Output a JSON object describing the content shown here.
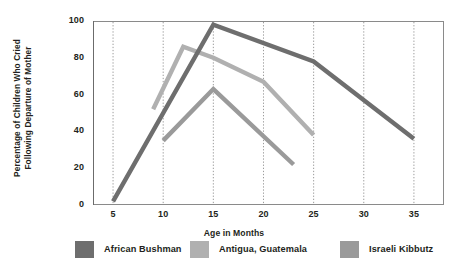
{
  "chart_data": {
    "type": "line",
    "title": "",
    "xlabel": "Age in Months",
    "ylabel_line1": "Percentage of Children Who Cried",
    "ylabel_line2": "Following Departure of Mother",
    "xlim": [
      3,
      38
    ],
    "ylim": [
      0,
      100
    ],
    "xticks": [
      5,
      10,
      15,
      20,
      25,
      30,
      35
    ],
    "xtick_labels": [
      "5",
      "10",
      "15",
      "20",
      "25",
      "30",
      "35"
    ],
    "yticks": [
      0,
      20,
      40,
      60,
      80,
      100
    ],
    "ytick_labels": [
      "0",
      "20",
      "40",
      "60",
      "80",
      "100"
    ],
    "grid": "vertical-dotted",
    "legend_position": "bottom",
    "series": [
      {
        "name": "African Bushman",
        "color": "#6e6e6e",
        "x": [
          5,
          15,
          25,
          35
        ],
        "values": [
          2,
          98,
          78,
          36
        ]
      },
      {
        "name": "Antigua, Guatemala",
        "color": "#b0b0b0",
        "x": [
          9,
          12,
          15,
          20,
          25
        ],
        "values": [
          52,
          86,
          80,
          67,
          38
        ]
      },
      {
        "name": "Israeli Kibbutz",
        "color": "#9a9a9a",
        "x": [
          10,
          15,
          23
        ],
        "values": [
          35,
          63,
          22
        ]
      }
    ]
  },
  "legend": {
    "items": [
      {
        "label": "African Bushman",
        "color": "#6e6e6e"
      },
      {
        "label": "Antigua, Guatemala",
        "color": "#b0b0b0"
      },
      {
        "label": "Israeli Kibbutz",
        "color": "#9a9a9a"
      }
    ]
  },
  "colors": {
    "plot_border": "#8a8a8a",
    "gridline": "#909090",
    "axis": "#6b6b6b",
    "text": "#231f20",
    "background": "#ffffff"
  }
}
